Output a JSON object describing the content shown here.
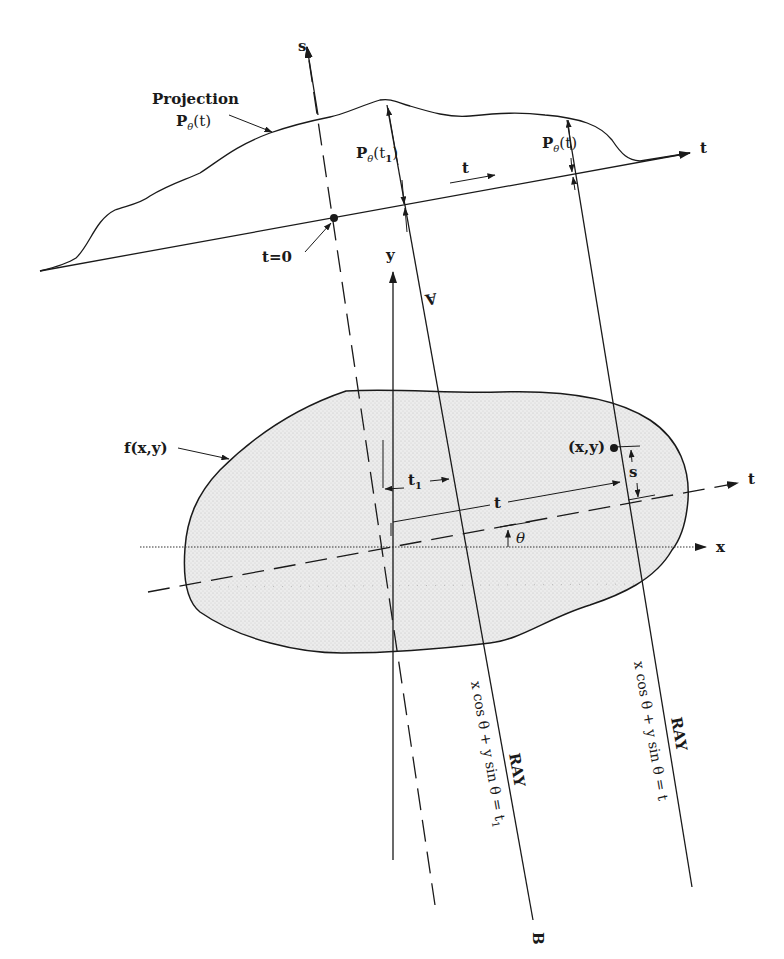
{
  "figure": {
    "colors": {
      "ink": "#1a1a1a",
      "object_fill": "#e6e6e6",
      "background": "#ffffff"
    }
  },
  "labels": {
    "projection_title": "Projection",
    "projection_func": "P",
    "projection_sub": "θ",
    "projection_arg": "(t)",
    "p_t1_func": "P",
    "p_t1_sub": "θ",
    "p_t1_arg_open": "(t",
    "p_t1_arg_sub": "1",
    "p_t1_arg_close": ")",
    "p_t_func": "P",
    "p_t_sub": "θ",
    "p_t_arg": "(t)",
    "t_direction": "t",
    "t_axis_top": "t",
    "t_zero": "t=0",
    "s_axis": "s",
    "y_axis": "y",
    "x_axis": "x",
    "t_axis_rotated": "t",
    "object_label": "f(x,y)",
    "point_label": "(x,y)",
    "s_distance": "s",
    "t1_distance": "t",
    "t1_distance_sub": "1",
    "t_distance": "t",
    "theta_angle": "θ",
    "ray_a_end": "A",
    "ray_b_end": "B",
    "ray1_title": "RAY",
    "ray1_equation": "x cos θ + y sin θ = t",
    "ray1_equation_sub": "1",
    "ray2_title": "RAY",
    "ray2_equation": "x cos θ + y sin θ = t"
  }
}
